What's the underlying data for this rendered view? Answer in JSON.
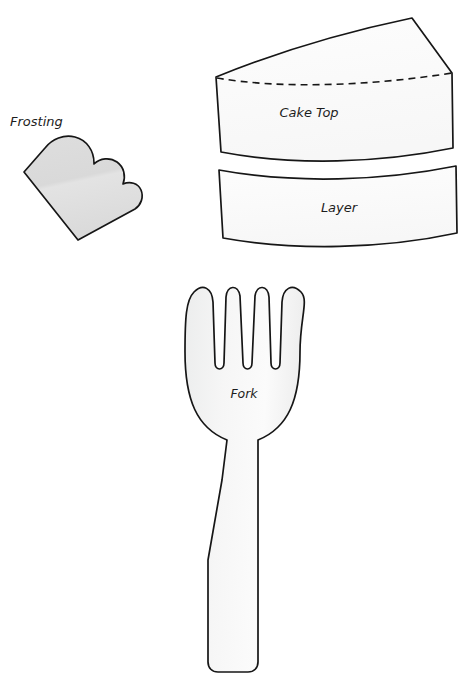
{
  "document": {
    "title": "Cake Slice Papercraft Pattern Sheet",
    "background_color": "#ffffff",
    "width": 471,
    "height": 678
  },
  "style": {
    "outline_color": "#161616",
    "frosting_fill": "#dcdcdc",
    "cake_fill": "#fcfcfc",
    "fork_fill": "#f2f2f2",
    "label_color": "#1d1d1d"
  },
  "pieces": [
    {
      "id": "frosting",
      "label": "Frosting",
      "label_position": "above-left",
      "fill": "#dcdcdc",
      "has_fold_line": false,
      "description": "scalloped frosting drip piece"
    },
    {
      "id": "cake-top",
      "label": "Cake Top",
      "label_position": "inside-center",
      "fill": "#fcfcfc",
      "has_fold_line": true,
      "fold_line_style": "dashed",
      "description": "wedge shaped cake top with dashed fold line"
    },
    {
      "id": "layer",
      "label": "Layer",
      "label_position": "inside-center",
      "fill": "#fcfcfc",
      "has_fold_line": false,
      "description": "curved band cake layer side"
    },
    {
      "id": "fork",
      "label": "Fork",
      "label_position": "inside-head",
      "fill": "#f2f2f2",
      "has_fold_line": false,
      "tine_count": 4,
      "description": "four tined fork with tapering handle"
    }
  ]
}
